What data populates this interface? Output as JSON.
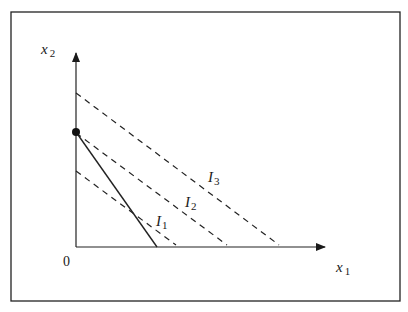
{
  "diagram": {
    "type": "economics-budget-indifference",
    "axes": {
      "x_label": "x",
      "x_subscript": "1",
      "y_label": "x",
      "y_subscript": "2",
      "origin_label": "0"
    },
    "budget_line": {
      "style": "solid",
      "description": "budget constraint from corner point on x2-axis"
    },
    "corner_point": {
      "marker": "filled-circle",
      "location": "on x2-axis at budget line intercept"
    },
    "indifference_curves": [
      {
        "name": "I",
        "subscript": "1",
        "style": "dashed"
      },
      {
        "name": "I",
        "subscript": "2",
        "style": "dashed"
      },
      {
        "name": "I",
        "subscript": "3",
        "style": "dashed"
      }
    ]
  }
}
